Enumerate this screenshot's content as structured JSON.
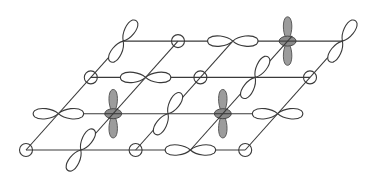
{
  "figure": {
    "title": "",
    "colors": {
      "line": "#3a3a3a",
      "filled_lobe": "#9c9c9c",
      "filled_outline": "#5a5a5a",
      "background": "#ffffff"
    },
    "lattice": {
      "origin": [
        26,
        150
      ],
      "a": [
        54.8,
        0
      ],
      "b": [
        32.4,
        -36.3
      ],
      "rows": 4,
      "cols": 5
    },
    "legend_types": {
      "s": "s-orbital (open circle)",
      "px": "p-orbital along horizontal lattice direction",
      "pd": "p-orbital along diagonal lattice direction",
      "dz": "filled vertical orbital with ring (d-orbital)"
    },
    "sites": [
      {
        "row": 0,
        "col": 0,
        "type": "s"
      },
      {
        "row": 0,
        "col": 1,
        "type": "pd"
      },
      {
        "row": 0,
        "col": 2,
        "type": "s"
      },
      {
        "row": 0,
        "col": 3,
        "type": "px"
      },
      {
        "row": 0,
        "col": 4,
        "type": "s"
      },
      {
        "row": 1,
        "col": 0,
        "type": "px"
      },
      {
        "row": 1,
        "col": 1,
        "type": "dz"
      },
      {
        "row": 1,
        "col": 2,
        "type": "pd"
      },
      {
        "row": 1,
        "col": 3,
        "type": "dz"
      },
      {
        "row": 1,
        "col": 4,
        "type": "px"
      },
      {
        "row": 2,
        "col": 0,
        "type": "s"
      },
      {
        "row": 2,
        "col": 1,
        "type": "px"
      },
      {
        "row": 2,
        "col": 2,
        "type": "s"
      },
      {
        "row": 2,
        "col": 3,
        "type": "pd"
      },
      {
        "row": 2,
        "col": 4,
        "type": "s"
      },
      {
        "row": 3,
        "col": 0,
        "type": "pd"
      },
      {
        "row": 3,
        "col": 1,
        "type": "s"
      },
      {
        "row": 3,
        "col": 2,
        "type": "px"
      },
      {
        "row": 3,
        "col": 3,
        "type": "dz"
      },
      {
        "row": 3,
        "col": 4,
        "type": "pd"
      }
    ]
  }
}
